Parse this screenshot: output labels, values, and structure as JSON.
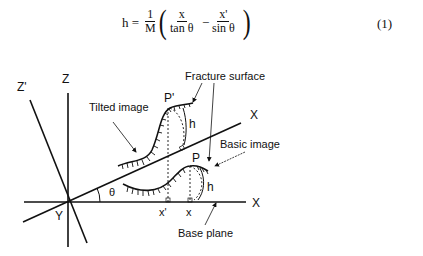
{
  "equation": {
    "lhs": "h =",
    "coef_num": "1",
    "coef_den": "M",
    "term1_num": "x",
    "term1_den": "tan θ",
    "operator": "−",
    "term2_num": "x'",
    "term2_den": "sin θ",
    "number": "(1)"
  },
  "diagram": {
    "axes": {
      "z": "Z",
      "z_tilted": "Z'",
      "x_tilted": "X",
      "x_base": "X",
      "y": "Y",
      "angle": "θ"
    },
    "points": {
      "p_tilted": "P'",
      "p_basic": "P",
      "x_tilted_proj": "x'",
      "x_basic_proj": "x",
      "h_upper": "h",
      "h_lower": "h"
    },
    "labels": {
      "tilted_image": "Tilted image",
      "fracture_surface": "Fracture surface",
      "basic_image": "Basic image",
      "base_plane": "Base plane"
    }
  }
}
